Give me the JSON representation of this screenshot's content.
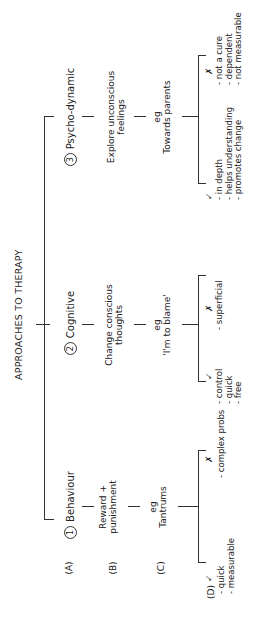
{
  "title": "APPROACHES TO THERAPY",
  "row_labels": {
    "a": "(A)",
    "b": "(B)",
    "c": "(C)",
    "d": "(D)"
  },
  "approaches": [
    {
      "number": "1",
      "name": "Behaviour",
      "method": [
        "Reward +",
        "punishment"
      ],
      "eg": "eg",
      "example": "Tantrums",
      "pros_mark": "✓",
      "cons_mark": "✗",
      "pros": [
        "quick",
        "measurable"
      ],
      "cons": [
        "complex probs"
      ]
    },
    {
      "number": "2",
      "name": "Cognitive",
      "method": [
        "Change conscious",
        "thoughts"
      ],
      "eg": "eg",
      "example": "'I'm to blame'",
      "pros_mark": "✓",
      "cons_mark": "✗",
      "pros": [
        "control",
        "quick",
        "free"
      ],
      "cons": [
        "superficial"
      ]
    },
    {
      "number": "3",
      "name": "Psycho-dynamic",
      "method": [
        "Explore unconscious",
        "feelings"
      ],
      "eg": "eg",
      "example": "Towards parents",
      "pros_mark": "✓",
      "cons_mark": "✗",
      "pros": [
        "in depth",
        "helps understanding",
        "promotes change"
      ],
      "cons": [
        "not a cure",
        "dependent",
        "not measurable"
      ]
    }
  ],
  "colors": {
    "ink": "#222222",
    "background": "#ffffff"
  }
}
